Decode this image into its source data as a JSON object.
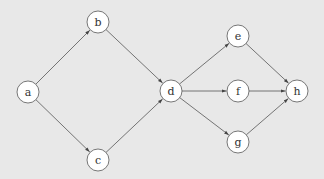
{
  "diagram": {
    "type": "directed-graph",
    "background": "#e8e8e8",
    "node_fill": "#ffffff",
    "stroke": "#555555",
    "node_radius": 11,
    "nodes": [
      {
        "id": "a",
        "label": "a",
        "x": 28,
        "y": 92
      },
      {
        "id": "b",
        "label": "b",
        "x": 98,
        "y": 22
      },
      {
        "id": "c",
        "label": "c",
        "x": 98,
        "y": 160
      },
      {
        "id": "d",
        "label": "d",
        "x": 171,
        "y": 91
      },
      {
        "id": "e",
        "label": "e",
        "x": 238,
        "y": 36
      },
      {
        "id": "f",
        "label": "f",
        "x": 238,
        "y": 91
      },
      {
        "id": "g",
        "label": "g",
        "x": 238,
        "y": 142
      },
      {
        "id": "h",
        "label": "h",
        "x": 297,
        "y": 91
      }
    ],
    "edges": [
      {
        "from": "a",
        "to": "b"
      },
      {
        "from": "a",
        "to": "c"
      },
      {
        "from": "b",
        "to": "d"
      },
      {
        "from": "c",
        "to": "d"
      },
      {
        "from": "d",
        "to": "e"
      },
      {
        "from": "d",
        "to": "f"
      },
      {
        "from": "d",
        "to": "g"
      },
      {
        "from": "e",
        "to": "h"
      },
      {
        "from": "f",
        "to": "h"
      },
      {
        "from": "g",
        "to": "h"
      }
    ]
  }
}
